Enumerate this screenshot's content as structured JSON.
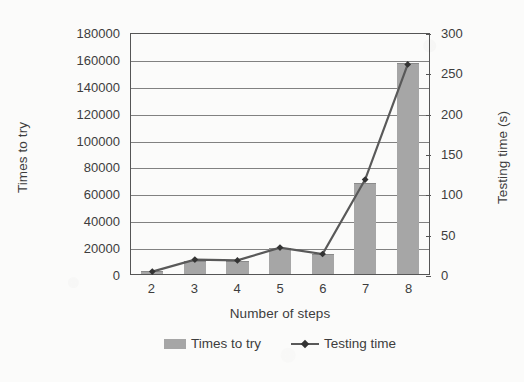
{
  "chart_data": {
    "type": "bar",
    "title": "",
    "categories": [
      "2",
      "3",
      "4",
      "5",
      "6",
      "7",
      "8"
    ],
    "xlabel": "Number of steps",
    "ylabel": "Times to try",
    "y2label": "Testing time (s)",
    "ylim": [
      0,
      180000
    ],
    "y2lim": [
      0,
      300
    ],
    "ytick_labels": [
      "180000",
      "160000",
      "140000",
      "120000",
      "100000",
      "80000",
      "60000",
      "40000",
      "20000",
      "0"
    ],
    "ytick_values": [
      180000,
      160000,
      140000,
      120000,
      100000,
      80000,
      60000,
      40000,
      20000,
      0
    ],
    "y2tick_labels": [
      "300",
      "250",
      "200",
      "150",
      "100",
      "50",
      "0"
    ],
    "y2tick_values": [
      300,
      250,
      200,
      150,
      100,
      50,
      0
    ],
    "grid": true,
    "legend_position": "bottom-center",
    "series": [
      {
        "name": "Times to try",
        "type": "bar",
        "axis": "left",
        "color": "#a6a6a6",
        "values": [
          2000,
          10000,
          10000,
          19000,
          15000,
          68000,
          157000
        ]
      },
      {
        "name": "Testing time",
        "type": "line",
        "axis": "right",
        "color": "#595959",
        "marker": "diamond",
        "values": [
          3,
          18,
          17,
          33,
          25,
          118,
          262
        ]
      }
    ]
  },
  "legend": {
    "items": [
      {
        "label": "Times to try",
        "swatch": "bar-swatch-gray"
      },
      {
        "label": "Testing time",
        "swatch": "line-swatch-marker"
      }
    ]
  },
  "colors": {
    "bar_fill": "#a6a6a6",
    "line": "#595959",
    "marker": "#333333",
    "gridline": "#6b6b6b",
    "axis": "#555555",
    "text": "#3d3d3d",
    "background": "#fbfbfa"
  }
}
